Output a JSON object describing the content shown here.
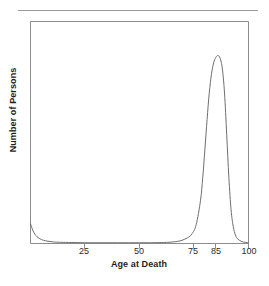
{
  "figure": {
    "background_color": "#ffffff",
    "frame_color": "#8c8c8c",
    "curve_color": "#6e6e6e",
    "text_color": "#1d1d1d",
    "top_rule_color": "#9a9a9a"
  },
  "chart_data": {
    "type": "line",
    "title": "",
    "subtitle": "",
    "xlabel": "Age at Death",
    "ylabel": "Number of Persons",
    "xlim": [
      0,
      100
    ],
    "ylim": [
      0,
      1
    ],
    "grid": false,
    "legend": null,
    "legend_position": "none",
    "xticks": [
      25,
      50,
      75,
      85,
      100
    ],
    "xtick_labels": [
      "25",
      "50",
      "75",
      "85",
      "100"
    ],
    "yticks": [],
    "ytick_labels": [],
    "annotations": [],
    "series": [
      {
        "name": "Deaths by age",
        "x": [
          0,
          1,
          2,
          3,
          4,
          5,
          6,
          8,
          10,
          12,
          15,
          20,
          25,
          30,
          35,
          40,
          45,
          50,
          55,
          60,
          63,
          66,
          69,
          72,
          74,
          76,
          78,
          79,
          80,
          81,
          82,
          83,
          84,
          85,
          86,
          87,
          88,
          89,
          90,
          91,
          92,
          93,
          94,
          95,
          97,
          100
        ],
        "y": [
          0.105,
          0.072,
          0.05,
          0.036,
          0.027,
          0.021,
          0.017,
          0.012,
          0.009,
          0.007,
          0.006,
          0.005,
          0.004,
          0.004,
          0.004,
          0.004,
          0.004,
          0.004,
          0.004,
          0.005,
          0.006,
          0.009,
          0.015,
          0.03,
          0.05,
          0.1,
          0.23,
          0.35,
          0.5,
          0.66,
          0.8,
          0.9,
          0.96,
          0.99,
          1.0,
          0.985,
          0.93,
          0.8,
          0.58,
          0.35,
          0.18,
          0.09,
          0.045,
          0.025,
          0.01,
          0.004
        ]
      }
    ]
  }
}
